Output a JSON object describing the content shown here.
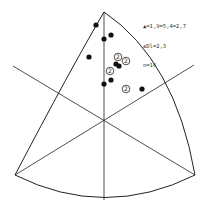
{
  "diagram": {
    "type": "spherical-triangle-projection",
    "legend": {
      "line1": "▲=1,9=5,4=2,7",
      "line2": "≤Dl=2,3",
      "line3": "n=16"
    },
    "points_solid": [
      {
        "x": 96,
        "y": 25
      },
      {
        "x": 111,
        "y": 35
      },
      {
        "x": 104,
        "y": 39
      },
      {
        "x": 89,
        "y": 57
      },
      {
        "x": 116,
        "y": 64
      },
      {
        "x": 119,
        "y": 66
      },
      {
        "x": 111,
        "y": 80
      },
      {
        "x": 104,
        "y": 84
      },
      {
        "x": 142,
        "y": 89
      }
    ],
    "points_double": [
      {
        "x": 118,
        "y": 57,
        "label": "2"
      },
      {
        "x": 126,
        "y": 61,
        "label": "2"
      },
      {
        "x": 110,
        "y": 71,
        "label": "2"
      },
      {
        "x": 126,
        "y": 89,
        "label": "2"
      }
    ],
    "colors": {
      "line": "#222222",
      "point": "#111111"
    }
  }
}
